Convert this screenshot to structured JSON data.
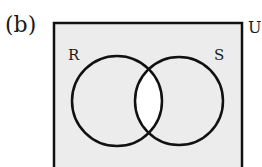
{
  "figure": {
    "panel_label": "(b)",
    "universe_label": "U",
    "sets": [
      {
        "label": "R",
        "cx": 117,
        "cy": 101,
        "r": 45
      },
      {
        "label": "S",
        "cx": 179,
        "cy": 101,
        "r": 44
      }
    ],
    "box": {
      "x": 54,
      "y": 23,
      "width": 188,
      "height": 160
    },
    "shading": {
      "shaded_region": "complement of R ∩ S",
      "unshaded_region": "R ∩ S",
      "shade_color": "#ececec",
      "unshaded_color": "#ffffff",
      "stroke_color": "#111111"
    }
  }
}
